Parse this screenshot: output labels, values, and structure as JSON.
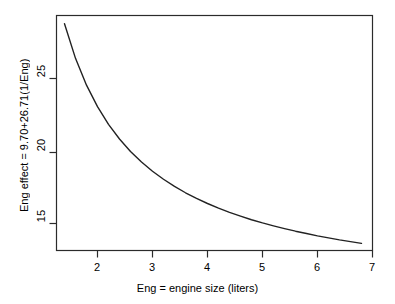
{
  "figure": {
    "background_color": "#ffffff",
    "foreground_color": "#000000",
    "line_color": "#1a1a1a"
  },
  "chart_data": {
    "type": "line",
    "title": "",
    "subtitle": "",
    "xlabel": "Eng = engine size (liters)",
    "ylabel": "Eng effect = 9.70+26.71(1/Eng)",
    "equation": "Eng effect = 9.70+26.71(1/Eng)",
    "intercept": 9.7,
    "coefficient": 26.71,
    "xlim": [
      1.35,
      7.0
    ],
    "ylim": [
      13.3,
      29.4
    ],
    "xticks": [
      2,
      3,
      4,
      5,
      6,
      7
    ],
    "yticks": [
      15,
      20,
      25
    ],
    "xtick_labels": [
      "2",
      "3",
      "4",
      "5",
      "6",
      "7"
    ],
    "ytick_labels": [
      "15",
      "20",
      "25"
    ],
    "grid": false,
    "legend": false,
    "legend_position": "none",
    "x": [
      1.4,
      1.6,
      1.8,
      2.0,
      2.2,
      2.4,
      2.6,
      2.8,
      3.0,
      3.2,
      3.4,
      3.6,
      3.8,
      4.0,
      4.2,
      4.4,
      4.6,
      4.8,
      5.0,
      5.2,
      5.4,
      5.6,
      5.8,
      6.0,
      6.2,
      6.4,
      6.6,
      6.8
    ],
    "y": [
      28.78,
      26.39,
      24.54,
      23.06,
      21.84,
      20.83,
      19.97,
      19.24,
      18.6,
      18.05,
      17.56,
      17.12,
      16.73,
      16.38,
      16.06,
      15.77,
      15.51,
      15.26,
      15.04,
      14.84,
      14.65,
      14.47,
      14.31,
      14.15,
      14.01,
      13.87,
      13.75,
      13.63
    ],
    "series": [
      {
        "name": "Eng effect",
        "values": [
          28.78,
          26.39,
          24.54,
          23.06,
          21.84,
          20.83,
          19.97,
          19.24,
          18.6,
          18.05,
          17.56,
          17.12,
          16.73,
          16.38,
          16.06,
          15.77,
          15.51,
          15.26,
          15.04,
          14.84,
          14.65,
          14.47,
          14.31,
          14.15,
          14.01,
          13.87,
          13.75,
          13.63
        ]
      }
    ]
  }
}
